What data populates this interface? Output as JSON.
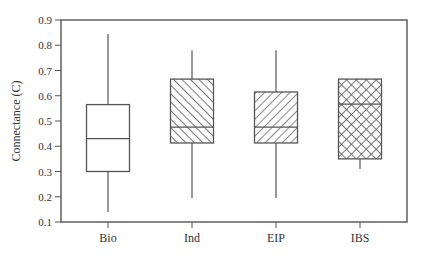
{
  "chart_data": {
    "type": "boxplot",
    "title": "",
    "xlabel": "",
    "ylabel": "Connectance (C)",
    "ylim": [
      0.1,
      0.9
    ],
    "yticks": [
      0.1,
      0.2,
      0.3,
      0.4,
      0.5,
      0.6,
      0.7,
      0.8,
      0.9
    ],
    "ytick_labels": [
      "0.1",
      "0.2",
      "0.3",
      "0.4",
      "0.5",
      "0.6",
      "0.7",
      "0.8",
      "0.9"
    ],
    "grid": false,
    "legend": "none",
    "categories": [
      "Bio",
      "Ind",
      "EIP",
      "IBS"
    ],
    "series": [
      {
        "name": "Bio",
        "whisker_low": 0.14,
        "q1": 0.3,
        "median": 0.43,
        "q3": 0.565,
        "whisker_high": 0.845,
        "fill": "none"
      },
      {
        "name": "Ind",
        "whisker_low": 0.195,
        "q1": 0.413,
        "median": 0.476,
        "q3": 0.666,
        "whisker_high": 0.78,
        "fill": "hatch-backslash"
      },
      {
        "name": "EIP",
        "whisker_low": 0.195,
        "q1": 0.413,
        "median": 0.476,
        "q3": 0.615,
        "whisker_high": 0.78,
        "fill": "hatch-slash"
      },
      {
        "name": "IBS",
        "whisker_low": 0.31,
        "q1": 0.35,
        "median": 0.567,
        "q3": 0.666,
        "whisker_high": 0.666,
        "fill": "crosshatch"
      }
    ]
  }
}
